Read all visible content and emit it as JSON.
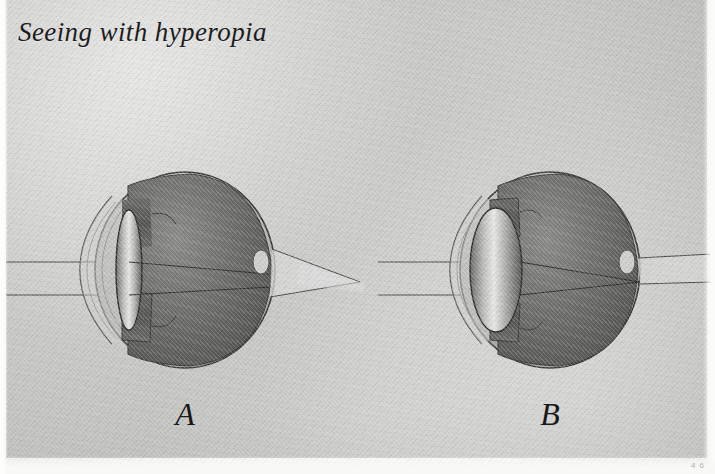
{
  "figure": {
    "title": "Seeing with hyperopia",
    "corner_mark": "4 6",
    "background_color": "#c9c9c7",
    "ink_color": "#1d1d1d",
    "caption_style": "italic serif"
  },
  "panels": [
    {
      "id": "A",
      "label": "A",
      "condition": "hyperopia, unaccommodated",
      "lens_shape": "thin / flat",
      "focal_point": "behind the retina",
      "center_x": 185,
      "center_y": 270,
      "globe_rx": 90,
      "globe_ry": 98,
      "lens_rx": 13,
      "lens_ry": 60,
      "focus_x": 360,
      "focus_y": 282
    },
    {
      "id": "B",
      "label": "B",
      "condition": "hyperopia, accommodated",
      "lens_shape": "thick / rounded",
      "focal_point": "on the retina",
      "center_x": 550,
      "center_y": 270,
      "globe_rx": 90,
      "globe_ry": 98,
      "lens_rx": 26,
      "lens_ry": 62,
      "focus_x": 640,
      "focus_y": 282
    }
  ],
  "rays": {
    "upper_y": 262,
    "lower_y": 295,
    "color": "#3a3a3a",
    "description": "two parallel horizontal light rays entering from the left"
  },
  "anatomy": {
    "sclera": "outer white coat",
    "cornea": "clear front dome",
    "iris": "dark band",
    "lens": "biconvex body",
    "vitreous": "dark interior",
    "optic_disc": "pale oval at rear"
  },
  "colors": {
    "sclera": "#b5b5b2",
    "vitreous": "#5e5e5e",
    "lens_light": "#d8d8d6",
    "outline": "#2e2e2e"
  }
}
